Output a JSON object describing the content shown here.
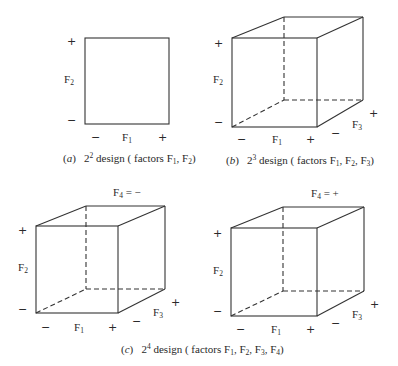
{
  "figure": {
    "panels": {
      "a": {
        "caption_letter": "a",
        "caption_base": "2",
        "caption_exp": "2",
        "caption_text": " design ( factors F",
        "caption_factors": [
          "1",
          "2"
        ],
        "axis_f1": {
          "name": "F",
          "sub": "1",
          "low": "−",
          "high": "+"
        },
        "axis_f2": {
          "name": "F",
          "sub": "2",
          "low": "−",
          "high": "+"
        }
      },
      "b": {
        "caption_letter": "b",
        "caption_base": "2",
        "caption_exp": "3",
        "caption_text": " design ( factors F",
        "caption_factors": [
          "1",
          "2",
          "3"
        ],
        "axis_f1": {
          "name": "F",
          "sub": "1",
          "low": "−",
          "high": "+"
        },
        "axis_f2": {
          "name": "F",
          "sub": "2",
          "low": "−",
          "high": "+"
        },
        "axis_f3": {
          "name": "F",
          "sub": "3",
          "low": "−",
          "high": "+"
        }
      },
      "c_left": {
        "title": "F",
        "title_sub": "4",
        "title_value": " = −",
        "axis_f1": {
          "name": "F",
          "sub": "1",
          "low": "−",
          "high": "+"
        },
        "axis_f2": {
          "name": "F",
          "sub": "2",
          "low": "−",
          "high": "+"
        },
        "axis_f3": {
          "name": "F",
          "sub": "3",
          "low": "−",
          "high": "+"
        }
      },
      "c_right": {
        "title": "F",
        "title_sub": "4",
        "title_value": " = +",
        "axis_f1": {
          "name": "F",
          "sub": "1",
          "low": "−",
          "high": "+"
        },
        "axis_f2": {
          "name": "F",
          "sub": "2",
          "low": "−",
          "high": "+"
        },
        "axis_f3": {
          "name": "F",
          "sub": "3",
          "low": "−",
          "high": "+"
        }
      },
      "c": {
        "caption_letter": "c",
        "caption_base": "2",
        "caption_exp": "4",
        "caption_text": " design ( factors F",
        "caption_factors": [
          "1",
          "2",
          "3",
          "4"
        ]
      }
    },
    "line_color": "#333333"
  }
}
